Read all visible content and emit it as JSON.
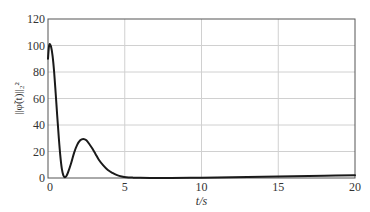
{
  "chart_data": {
    "type": "line",
    "title": "",
    "xlabel": "t/s",
    "ylabel": "||φ̃(t)||₂²",
    "xlim": [
      0,
      20
    ],
    "ylim": [
      0,
      120
    ],
    "xticks": [
      0,
      5,
      10,
      15,
      20
    ],
    "yticks": [
      0,
      20,
      40,
      60,
      80,
      100,
      120
    ],
    "grid": true,
    "legend": null,
    "series": [
      {
        "name": "norm",
        "color": "#1a1a1a",
        "x": [
          0,
          0.05,
          0.1,
          0.2,
          0.3,
          0.4,
          0.5,
          0.6,
          0.7,
          0.8,
          0.9,
          1.0,
          1.1,
          1.2,
          1.3,
          1.5,
          1.7,
          1.9,
          2.1,
          2.3,
          2.5,
          2.7,
          2.9,
          3.1,
          3.3,
          3.6,
          3.9,
          4.2,
          4.5,
          4.8,
          5.1,
          5.5,
          6.0,
          7,
          8,
          10,
          12,
          14,
          16,
          18,
          20
        ],
        "values": [
          90,
          98,
          101,
          99,
          92,
          80,
          64,
          47,
          31,
          17,
          7,
          2,
          0.5,
          1.5,
          4,
          11,
          19,
          25,
          28.5,
          29.5,
          28.5,
          25.5,
          22,
          18,
          14,
          9.5,
          6,
          3.8,
          2.2,
          1.2,
          0.6,
          0.3,
          0.1,
          0,
          0,
          0.2,
          0.5,
          0.9,
          1.3,
          1.7,
          2.1
        ]
      }
    ]
  },
  "layout": {
    "plot_left": 48,
    "plot_right": 355,
    "plot_top": 19,
    "plot_bottom": 178
  },
  "colors": {
    "axis": "#555555",
    "grid": "#d0d0d0",
    "line": "#1a1a1a"
  }
}
